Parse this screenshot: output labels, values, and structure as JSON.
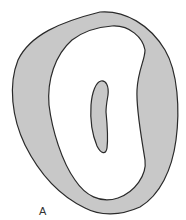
{
  "figure": {
    "label": "A",
    "colors": {
      "fill": "#c8c8c8",
      "outline": "#2a2a2a",
      "background": "#ffffff"
    },
    "shapes": [
      "outer-wall",
      "inner-cavity",
      "central-canal"
    ]
  }
}
